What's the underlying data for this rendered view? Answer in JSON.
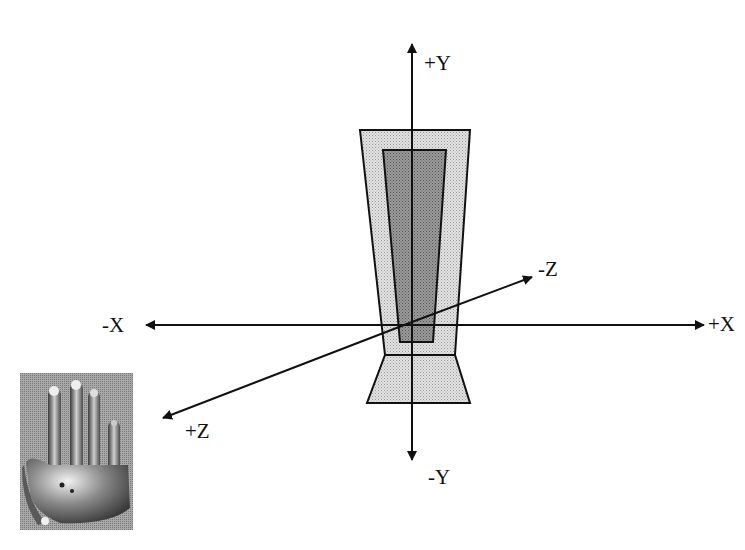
{
  "diagram": {
    "type": "3d-coordinate-axes",
    "axes": {
      "plus_y": "+Y",
      "minus_y": "-Y",
      "plus_x": "+X",
      "minus_x": "-X",
      "plus_z": "+Z",
      "minus_z": "-Z"
    },
    "shapes": {
      "outer_body": "light-gray stippled trapezoid (sensor housing)",
      "inner_body": "dark-gray stippled trapezoid (sensor core)",
      "base": "light-gray stippled trapezoid base"
    },
    "image": {
      "subject": "robotic hand / data glove photo",
      "tone": "grayscale halftone"
    },
    "colors": {
      "line": "#111111",
      "outer_fill": "#d8d8d8",
      "inner_fill": "#8a8a8a",
      "background": "#ffffff"
    }
  }
}
